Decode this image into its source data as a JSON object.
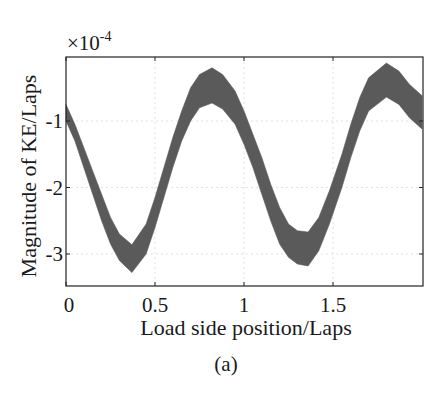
{
  "figure": {
    "caption": "(a)"
  },
  "chart_data": {
    "type": "area",
    "title": "",
    "xlabel": "Load side position/Laps",
    "ylabel": "Magnitude of KE/Laps",
    "y_exponent_label": "×10",
    "y_exponent_power": "-4",
    "xlim": [
      0,
      2.0
    ],
    "ylim": [
      -3.5,
      0.05
    ],
    "x_ticks": [
      0,
      0.5,
      1,
      1.5
    ],
    "x_tick_labels": [
      "0",
      "0.5",
      "1",
      "1.5"
    ],
    "y_ticks": [
      -1,
      -2,
      -3
    ],
    "y_tick_labels": [
      "-1",
      "-2",
      "-3"
    ],
    "grid": true,
    "legend": null,
    "band_color": "#5a5a5a",
    "note": "Dense noisy oscillating signal rendered as a filled band between upper and lower envelopes (values ×1e-4)",
    "series": [
      {
        "name": "upper_envelope",
        "x": [
          0.0,
          0.05,
          0.1,
          0.15,
          0.2,
          0.25,
          0.3,
          0.37,
          0.45,
          0.5,
          0.55,
          0.6,
          0.65,
          0.7,
          0.75,
          0.82,
          0.88,
          0.95,
          1.0,
          1.05,
          1.1,
          1.15,
          1.2,
          1.25,
          1.3,
          1.36,
          1.42,
          1.48,
          1.55,
          1.6,
          1.65,
          1.7,
          1.8,
          1.87,
          1.93,
          2.0
        ],
        "values": [
          -0.75,
          -1.05,
          -1.4,
          -1.75,
          -2.1,
          -2.45,
          -2.7,
          -2.86,
          -2.55,
          -2.15,
          -1.7,
          -1.25,
          -0.85,
          -0.5,
          -0.3,
          -0.2,
          -0.3,
          -0.55,
          -0.85,
          -1.2,
          -1.55,
          -1.95,
          -2.3,
          -2.55,
          -2.65,
          -2.67,
          -2.45,
          -2.05,
          -1.5,
          -1.05,
          -0.65,
          -0.35,
          -0.13,
          -0.25,
          -0.45,
          -0.62
        ]
      },
      {
        "name": "lower_envelope",
        "x": [
          0.0,
          0.05,
          0.1,
          0.15,
          0.2,
          0.25,
          0.3,
          0.37,
          0.45,
          0.5,
          0.55,
          0.6,
          0.65,
          0.7,
          0.75,
          0.82,
          0.88,
          0.95,
          1.0,
          1.05,
          1.1,
          1.15,
          1.2,
          1.25,
          1.3,
          1.36,
          1.42,
          1.48,
          1.55,
          1.6,
          1.65,
          1.7,
          1.8,
          1.87,
          1.93,
          2.0
        ],
        "values": [
          -1.0,
          -1.3,
          -1.7,
          -2.1,
          -2.5,
          -2.85,
          -3.1,
          -3.28,
          -3.0,
          -2.6,
          -2.15,
          -1.7,
          -1.3,
          -1.0,
          -0.8,
          -0.73,
          -0.82,
          -1.05,
          -1.35,
          -1.7,
          -2.1,
          -2.5,
          -2.85,
          -3.05,
          -3.15,
          -3.18,
          -2.95,
          -2.55,
          -2.0,
          -1.55,
          -1.15,
          -0.85,
          -0.64,
          -0.75,
          -0.95,
          -1.12
        ]
      }
    ]
  }
}
